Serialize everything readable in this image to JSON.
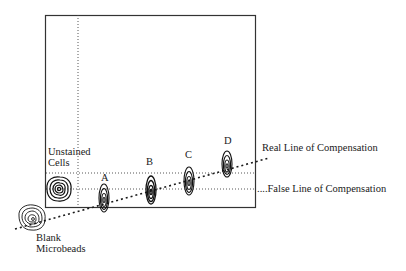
{
  "diagram": {
    "type": "flow-cytometry-compensation-diagram",
    "plot_box": {
      "left": 45,
      "top": 15,
      "right": 256,
      "bottom": 207
    },
    "gates": {
      "vertical_dotted_x": 78,
      "horizontal_dotted_upper_y": 173,
      "horizontal_dotted_lower_y": 189
    },
    "populations": [
      {
        "id": "unstained",
        "label_lines": [
          "Unstained",
          "Cells"
        ],
        "cx": 59,
        "cy": 189,
        "rx": 13,
        "ry": 13,
        "shape": "round"
      },
      {
        "id": "blank",
        "label_lines": [
          "Blank",
          "Microbeads"
        ],
        "cx": 32,
        "cy": 218,
        "rx": 14,
        "ry": 13,
        "shape": "round"
      },
      {
        "id": "A",
        "label": "A",
        "cx": 104,
        "cy": 198,
        "rx": 5,
        "ry": 14,
        "shape": "elongated"
      },
      {
        "id": "B",
        "label": "B",
        "cx": 151,
        "cy": 190,
        "rx": 5,
        "ry": 14,
        "shape": "elongated"
      },
      {
        "id": "C",
        "label": "C",
        "cx": 189,
        "cy": 181,
        "rx": 5,
        "ry": 14,
        "shape": "elongated"
      },
      {
        "id": "D",
        "label": "D",
        "cx": 227,
        "cy": 164,
        "rx": 5,
        "ry": 14,
        "shape": "elongated"
      }
    ],
    "lines": {
      "real": {
        "label": "Real Line of Compensation",
        "x1": 15,
        "y1": 229,
        "x2": 269,
        "y2": 158
      },
      "false": {
        "label": "False Line of Compensation",
        "prefix": "....",
        "y": 189
      }
    },
    "labels": {
      "unstained_line1": "Unstained",
      "unstained_line2": "Cells",
      "blank_line1": "Blank",
      "blank_line2": "Microbeads",
      "A": "A",
      "B": "B",
      "C": "C",
      "D": "D",
      "real_line": "Real Line of Compensation",
      "false_line": "....False Line of Compensation"
    },
    "colors": {
      "ink": "#1a1a1a",
      "background": "#ffffff"
    }
  }
}
